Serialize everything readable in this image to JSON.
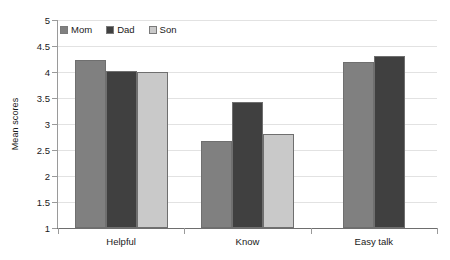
{
  "chart_data": {
    "type": "bar",
    "title": "",
    "xlabel": "",
    "ylabel": "Mean scores",
    "categories": [
      "Helpful",
      "Know",
      "Easy talk"
    ],
    "series": [
      {
        "name": "Mom",
        "color": "#808080",
        "values": [
          4.23,
          2.67,
          4.19
        ]
      },
      {
        "name": "Dad",
        "color": "#404040",
        "values": [
          4.02,
          3.42,
          4.31
        ]
      },
      {
        "name": "Son",
        "color": "#c9c9c9",
        "values": [
          4.0,
          2.81,
          null
        ]
      }
    ],
    "ylim": [
      1,
      5
    ],
    "ytick_step": 0.5,
    "yticks": [
      "5",
      "4.5",
      "4",
      "3.5",
      "3",
      "2.5",
      "2",
      "1.5",
      "1"
    ],
    "grid": true,
    "legend_position": "top-left"
  },
  "axes": {
    "y_title": "Mean scores"
  }
}
